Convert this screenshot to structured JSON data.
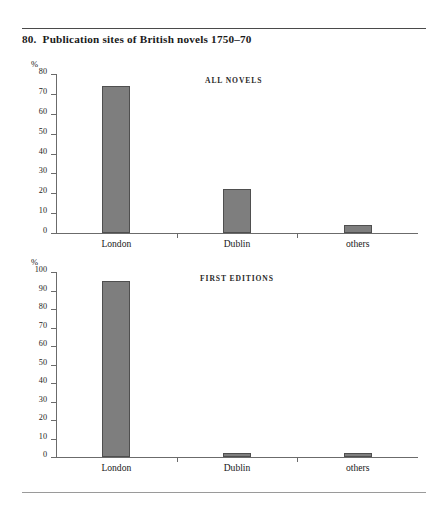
{
  "figure": {
    "number": "80.",
    "title": "Publication sites of British novels 1750–70"
  },
  "chart_data": [
    {
      "type": "bar",
      "title": "ALL NOVELS",
      "categories": [
        "London",
        "Dublin",
        "others"
      ],
      "values": [
        74,
        22,
        4
      ],
      "xlabel": "",
      "ylabel": "%",
      "ylim": [
        0,
        80
      ],
      "yticks": [
        0,
        10,
        20,
        30,
        40,
        50,
        60,
        70,
        80
      ],
      "ytick_labels": [
        "0",
        "10",
        "20",
        "30",
        "40",
        "50",
        "60",
        "70",
        "80"
      ],
      "grid": false,
      "legend": "none"
    },
    {
      "type": "bar",
      "title": "FIRST EDITIONS",
      "categories": [
        "London",
        "Dublin",
        "others"
      ],
      "values": [
        95,
        2,
        2
      ],
      "xlabel": "",
      "ylabel": "%",
      "ylim": [
        0,
        100
      ],
      "yticks": [
        0,
        10,
        20,
        30,
        40,
        50,
        60,
        70,
        80,
        90,
        100
      ],
      "ytick_labels": [
        "0",
        "10",
        "20",
        "30",
        "40",
        "50",
        "60",
        "70",
        "80",
        "90",
        "100"
      ],
      "grid": false,
      "legend": "none"
    }
  ],
  "style": {
    "bar_fill": "#7e7e7e",
    "bar_stroke": "#4f4f4f",
    "axis_color": "#6b6b6b",
    "text_color": "#1a1a1a",
    "background": "#ffffff"
  }
}
